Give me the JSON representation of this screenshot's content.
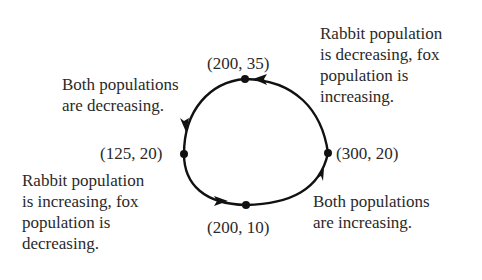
{
  "diagram": {
    "type": "cycle",
    "points": [
      {
        "id": "top",
        "label": "(200, 35)",
        "x": 200,
        "y": 35
      },
      {
        "id": "left",
        "label": "(125, 20)",
        "x": 125,
        "y": 20
      },
      {
        "id": "bottom",
        "label": "(200, 10)",
        "x": 200,
        "y": 10
      },
      {
        "id": "right",
        "label": "(300, 20)",
        "x": 300,
        "y": 20
      }
    ],
    "direction": "counterclockwise",
    "annotations": {
      "top_left": [
        "Both populations",
        "are decreasing."
      ],
      "top_right": [
        "Rabbit population",
        "is decreasing, fox",
        "population is",
        "increasing."
      ],
      "bottom_left": [
        "Rabbit population",
        "is increasing, fox",
        "population is",
        "decreasing."
      ],
      "bottom_right": [
        "Both populations",
        "are increasing."
      ]
    },
    "colors": {
      "line": "#111111",
      "text": "#2a2a2a",
      "background": "#ffffff"
    }
  }
}
